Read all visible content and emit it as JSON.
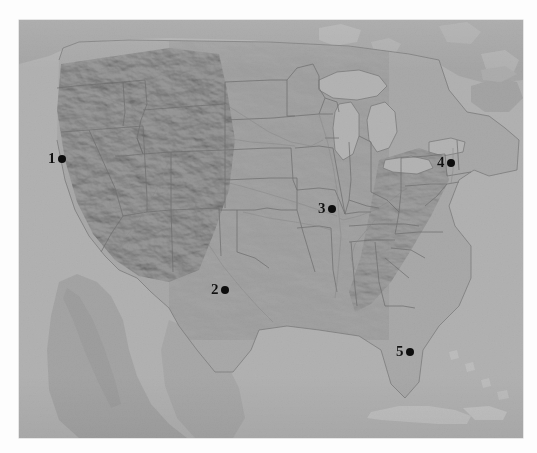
{
  "figure": {
    "type": "map",
    "title": "",
    "region": "Continental United States",
    "style": "grayscale shaded relief with state boundaries",
    "background_color": "#ffffff",
    "land_color": "#a9a9a9",
    "water_color": "#b4b4b4",
    "border_color": "#6e6e6e",
    "marker_color": "#0d0d0d",
    "width": 504,
    "height": 418,
    "left": 19,
    "top": 20
  },
  "markers": [
    {
      "id": "marker-1",
      "label": "1",
      "x": 29,
      "y": 138,
      "dot_x": 47,
      "dot_y": 138,
      "region": "Pacific Northwest coast"
    },
    {
      "id": "marker-2",
      "label": "2",
      "x": 192,
      "y": 269,
      "dot_x": 208,
      "dot_y": 270,
      "region": "Texas"
    },
    {
      "id": "marker-3",
      "label": "3",
      "x": 299,
      "y": 188,
      "dot_x": 315,
      "dot_y": 189,
      "region": "Illinois / Indiana"
    },
    {
      "id": "marker-4",
      "label": "4",
      "x": 418,
      "y": 142,
      "dot_x": 433,
      "dot_y": 143,
      "region": "New York"
    },
    {
      "id": "marker-5",
      "label": "5",
      "x": 377,
      "y": 331,
      "dot_x": 392,
      "dot_y": 332,
      "region": "Florida"
    }
  ],
  "legend": {
    "visible": false,
    "entries": []
  },
  "axes": {
    "visible": false
  }
}
